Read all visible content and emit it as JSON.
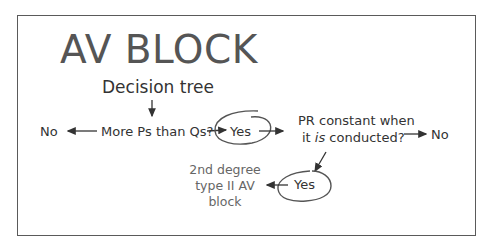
{
  "diagram": {
    "title": "AV BLOCK",
    "subtitle": "Decision tree",
    "nodes": {
      "q1": "More Ps than Qs?",
      "q1_no": "No",
      "q1_yes": "Yes",
      "q2_line1": "PR constant when",
      "q2_line2_pre": "it ",
      "q2_line2_em": "is",
      "q2_line2_post": " conducted?",
      "q2_no": "No",
      "q2_yes": "Yes",
      "result_line1": "2nd degree",
      "result_line2": "type II AV",
      "result_line3": "block"
    },
    "edges": [
      {
        "from": "subtitle",
        "to": "q1"
      },
      {
        "from": "q1",
        "to": "q1_no"
      },
      {
        "from": "q1",
        "to": "q1_yes"
      },
      {
        "from": "q1_yes",
        "to": "q2"
      },
      {
        "from": "q2",
        "to": "q2_no"
      },
      {
        "from": "q2",
        "to": "q2_yes"
      },
      {
        "from": "q2_yes",
        "to": "result"
      }
    ],
    "colors": {
      "text": "#333333",
      "title": "#555555",
      "result": "#666666",
      "stroke": "#333333"
    }
  }
}
